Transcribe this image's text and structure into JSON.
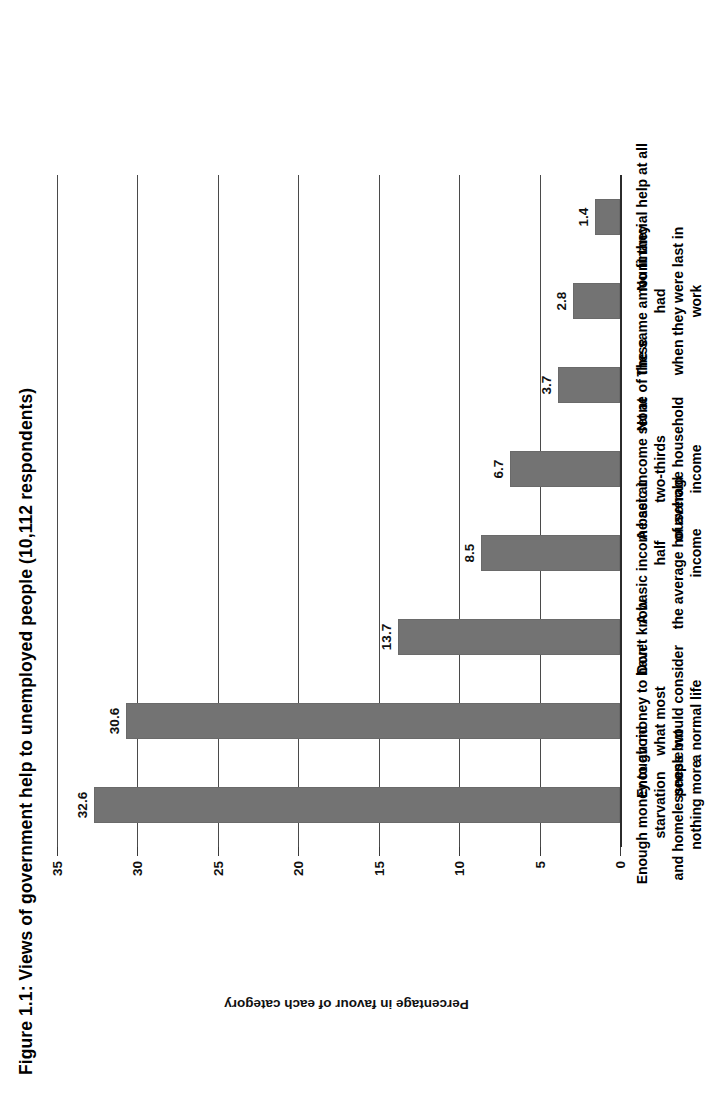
{
  "figure": {
    "title": "Figure 1.1: Views of government help to unemployed people (10,112 respondents)",
    "axis_title": "Percentage in favour of each category",
    "bar_color": "#737373",
    "grid_color": "#4a4a4a",
    "text_color": "#111111"
  },
  "chart_data": {
    "type": "bar",
    "title": "Figure 1.1: Views of government help to unemployed people (10,112 respondents)",
    "xlabel": "",
    "ylabel": "Percentage in favour of each category",
    "ylim": [
      0,
      35
    ],
    "yticks": [
      0,
      5,
      10,
      15,
      20,
      25,
      30,
      35
    ],
    "ytick_labels": [
      "0",
      "5",
      "10",
      "15",
      "20",
      "25",
      "30",
      "35"
    ],
    "grid": true,
    "legend": false,
    "orientation": "vertical",
    "respondents": "10,112",
    "categories": [
      "Enough money to avoid starvation\nand homelessness but nothing more",
      "Enough money to have what most\npeople would consider a normal life",
      "Don't know",
      "A basic income set at half\nthe average household income",
      "A basic income set at two-thirds\nof average household income",
      "None of these",
      "The same amount they had\nwhen they were last in work",
      "No financial help at all"
    ],
    "values": [
      32.6,
      30.6,
      13.7,
      8.5,
      6.7,
      3.7,
      2.8,
      1.4
    ],
    "value_labels": [
      "32.6",
      "30.6",
      "13.7",
      "8.5",
      "6.7",
      "3.7",
      "2.8",
      "1.4"
    ]
  }
}
